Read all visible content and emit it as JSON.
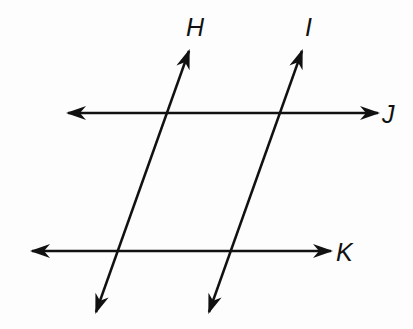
{
  "diagram": {
    "stroke_color": "#111111",
    "lines": [
      {
        "name": "H",
        "label": "H",
        "x1": 96,
        "y1": 312,
        "x2": 189,
        "y2": 51,
        "label_x": 186,
        "label_y": 36
      },
      {
        "name": "I",
        "label": "I",
        "x1": 209,
        "y1": 312,
        "x2": 302,
        "y2": 51,
        "label_x": 305,
        "label_y": 36
      },
      {
        "name": "J",
        "label": "J",
        "x1": 68,
        "y1": 113,
        "x2": 378,
        "y2": 113,
        "label_x": 382,
        "label_y": 123
      },
      {
        "name": "K",
        "label": "K",
        "x1": 32,
        "y1": 251,
        "x2": 331,
        "y2": 251,
        "label_x": 336,
        "label_y": 261
      }
    ]
  }
}
